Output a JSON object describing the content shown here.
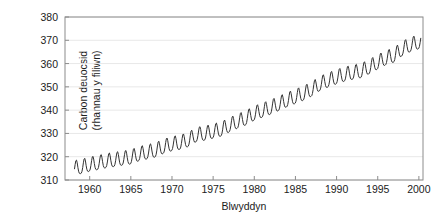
{
  "chart_data": {
    "type": "line",
    "title": "",
    "xlabel": "Blwyddyn",
    "ylabel_lines": [
      "Carbon deuocsid",
      "(rhannau y filiwn)"
    ],
    "ylabel": "Carbon deuocsid (rhannau y filiwn)",
    "xlim": [
      1957.0,
      2000.5
    ],
    "ylim": [
      310,
      380
    ],
    "xticks": [
      1960,
      1965,
      1970,
      1975,
      1980,
      1985,
      1990,
      1995,
      2000
    ],
    "xtick_labels": [
      "1960",
      "1965",
      "1970",
      "1975",
      "1980",
      "1985",
      "1990",
      "1995",
      "2000"
    ],
    "yticks": [
      310,
      320,
      330,
      340,
      350,
      360,
      370,
      380
    ],
    "ytick_labels": [
      "310",
      "320",
      "330",
      "340",
      "350",
      "360",
      "370",
      "380"
    ],
    "grid": "horizontal",
    "grid_color": "#e8e8e8",
    "line_color": "#333333",
    "line_width": 1.0,
    "background": "#ffffff",
    "legend": "none",
    "series": [
      {
        "name": "Carbon deuocsid",
        "annual_mean": {
          "x": [
            1958,
            1959,
            1960,
            1961,
            1962,
            1963,
            1964,
            1965,
            1966,
            1967,
            1968,
            1969,
            1970,
            1971,
            1972,
            1973,
            1974,
            1975,
            1976,
            1977,
            1978,
            1979,
            1980,
            1981,
            1982,
            1983,
            1984,
            1985,
            1986,
            1987,
            1988,
            1989,
            1990,
            1991,
            1992,
            1993,
            1994,
            1995,
            1996,
            1997,
            1998,
            1999,
            2000
          ],
          "y": [
            315.3,
            315.9,
            316.9,
            317.6,
            318.4,
            318.9,
            319.5,
            320.0,
            321.4,
            322.2,
            323.0,
            324.6,
            325.7,
            326.3,
            327.5,
            329.7,
            330.2,
            331.1,
            332.0,
            333.8,
            335.4,
            336.8,
            338.8,
            340.1,
            341.4,
            343.0,
            344.6,
            346.0,
            347.4,
            349.2,
            351.6,
            353.1,
            354.4,
            355.6,
            356.4,
            357.1,
            358.8,
            360.8,
            362.6,
            363.8,
            366.6,
            368.3,
            369.5
          ]
        },
        "seasonal_amplitude_ppm": 6.2,
        "description": "Keeling curve: monthly atmospheric CO2 concentration at Mauna Loa, rising from about 315 ppm in 1958 to about 370 ppm in 2000, with an annual sawtooth oscillation of roughly 6 ppm peak-to-trough (peak in May, minimum in late September)."
      }
    ]
  },
  "axes": {
    "frame_color": "#8c8c8c",
    "tick_color": "#8c8c8c"
  }
}
